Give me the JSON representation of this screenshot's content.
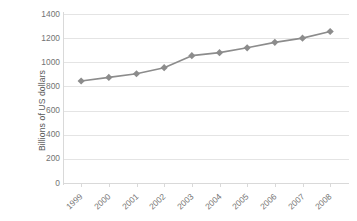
{
  "chart_data": {
    "type": "line",
    "title": "",
    "subtitle": "",
    "xlabel": "",
    "ylabel": "Billions of US dollars",
    "categories": [
      "1999",
      "2000",
      "2001",
      "2002",
      "2003",
      "2004",
      "2005",
      "2006",
      "2007",
      "2008"
    ],
    "values": [
      845,
      875,
      905,
      955,
      1055,
      1080,
      1120,
      1165,
      1200,
      1255
    ],
    "series": [
      {
        "name": "Billions of US dollars",
        "values": [
          845,
          875,
          905,
          955,
          1055,
          1080,
          1120,
          1165,
          1200,
          1255
        ]
      }
    ],
    "ylim": [
      0,
      1400
    ],
    "yticks": [
      0,
      200,
      400,
      600,
      800,
      1000,
      1200,
      1400
    ],
    "ytick_labels": [
      "0",
      "200",
      "400",
      "600",
      "800",
      "1000",
      "1200",
      "1400"
    ],
    "grid": "horizontal",
    "legend": "none",
    "marker": "diamond",
    "xtick_label_rotation": -43
  },
  "style": {
    "series_color": "#8c8c8c",
    "marker_color": "#8c8c8c",
    "gridline_color": "#e4e4e4",
    "axis_color": "#d9d9d9",
    "tick_label_color": "#737373",
    "axis_title_color": "#595959",
    "background_color": "#ffffff"
  }
}
